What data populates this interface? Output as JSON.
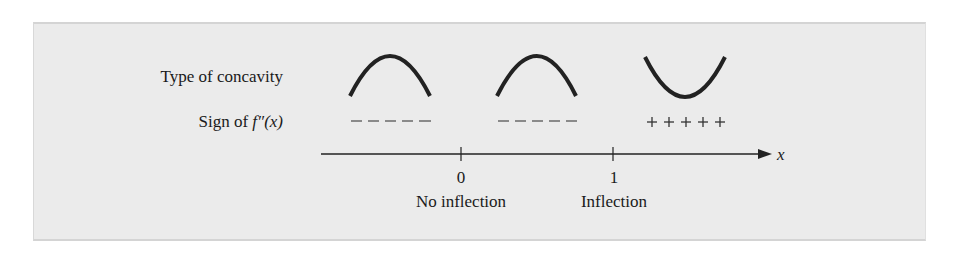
{
  "diagram": {
    "row_labels": {
      "concavity": "Type of concavity",
      "sign_prefix": "Sign of ",
      "sign_func": "f″(x)"
    },
    "intervals": [
      {
        "concavity": "down",
        "sign": "– – – – –"
      },
      {
        "concavity": "down",
        "sign": "– – – – –"
      },
      {
        "concavity": "up",
        "sign": "+++++"
      }
    ],
    "axis": {
      "variable": "x",
      "ticks": [
        {
          "value": "0",
          "caption": "No inflection"
        },
        {
          "value": "1",
          "caption": "Inflection"
        }
      ]
    },
    "colors": {
      "panel_background": "#ebebeb",
      "ink": "#1a1a1a"
    }
  }
}
